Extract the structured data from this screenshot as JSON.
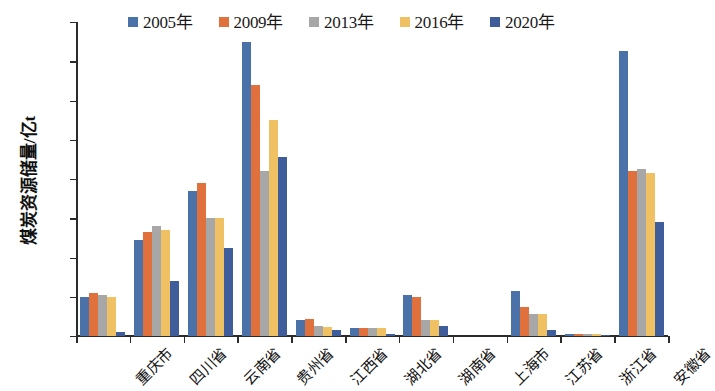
{
  "chart_data": {
    "type": "bar",
    "title": "",
    "xlabel": "",
    "ylabel": "煤炭资源储量/亿t",
    "ylim": [
      0,
      160
    ],
    "yticks": [
      0,
      20,
      40,
      60,
      80,
      100,
      120,
      140,
      160
    ],
    "grid": false,
    "legend_position": "top",
    "categories": [
      "重庆市",
      "四川省",
      "云南省",
      "贵州省",
      "江西省",
      "湖北省",
      "湖南省",
      "上海市",
      "江苏省",
      "浙江省",
      "安徽省"
    ],
    "series": [
      {
        "name": "2005年",
        "color": "#4a72a8",
        "values": [
          20,
          49,
          74,
          150,
          8,
          4,
          21,
          0,
          23,
          1,
          145
        ]
      },
      {
        "name": "2009年",
        "color": "#e1713c",
        "values": [
          22,
          53,
          78,
          128,
          8.5,
          4,
          20,
          0,
          15,
          1,
          84
        ]
      },
      {
        "name": "2013年",
        "color": "#a7a7a7",
        "values": [
          21,
          56,
          60,
          84,
          5,
          4,
          8,
          0,
          11,
          1,
          85
        ]
      },
      {
        "name": "2016年",
        "color": "#f0c163",
        "values": [
          20,
          54,
          60,
          110,
          4.5,
          4,
          8,
          0,
          11,
          1,
          83
        ]
      },
      {
        "name": "2020年",
        "color": "#3f5d9b",
        "values": [
          2,
          28,
          45,
          91,
          3,
          1,
          5,
          0,
          3,
          0.5,
          58
        ]
      }
    ]
  }
}
